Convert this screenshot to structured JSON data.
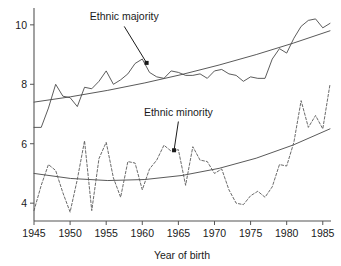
{
  "chart_data": {
    "type": "line",
    "title": "",
    "xlabel": "Year of birth",
    "ylabel": "",
    "xlim": [
      1945,
      1986
    ],
    "ylim": [
      3.4,
      10.5
    ],
    "xticks": [
      1945,
      1950,
      1955,
      1960,
      1965,
      1970,
      1975,
      1980,
      1985
    ],
    "yticks": [
      4,
      6,
      8,
      10
    ],
    "grid": false,
    "legend_position": "inline-annotations",
    "x": [
      1945,
      1946,
      1947,
      1948,
      1949,
      1950,
      1951,
      1952,
      1953,
      1954,
      1955,
      1956,
      1957,
      1958,
      1959,
      1960,
      1961,
      1962,
      1963,
      1964,
      1965,
      1966,
      1967,
      1968,
      1969,
      1970,
      1971,
      1972,
      1973,
      1974,
      1975,
      1976,
      1977,
      1978,
      1979,
      1980,
      1981,
      1982,
      1983,
      1984,
      1985,
      1986
    ],
    "series": [
      {
        "name": "Ethnic majority",
        "style": "solid",
        "color": "#4a4a4a",
        "values": [
          6.55,
          6.55,
          7.2,
          8.0,
          7.6,
          7.55,
          7.25,
          7.9,
          7.85,
          8.1,
          8.45,
          8.0,
          8.15,
          8.35,
          8.7,
          8.85,
          8.4,
          8.25,
          8.2,
          8.45,
          8.4,
          8.3,
          8.3,
          8.35,
          8.2,
          8.45,
          8.5,
          8.35,
          8.3,
          8.1,
          8.25,
          8.2,
          8.2,
          8.85,
          9.2,
          9.05,
          9.55,
          9.95,
          10.15,
          10.2,
          9.9,
          10.05
        ]
      },
      {
        "name": "Ethnic minority",
        "style": "dashed",
        "color": "#5a5a5a",
        "values": [
          3.75,
          4.6,
          5.3,
          5.1,
          4.35,
          3.7,
          4.8,
          6.1,
          3.75,
          5.5,
          6.05,
          4.85,
          4.2,
          5.4,
          5.35,
          4.45,
          5.15,
          5.45,
          5.95,
          5.75,
          5.8,
          4.6,
          5.9,
          5.45,
          5.4,
          5.0,
          5.15,
          4.45,
          4.0,
          3.95,
          4.25,
          4.4,
          4.2,
          4.55,
          5.3,
          5.25,
          6.05,
          7.45,
          6.55,
          6.95,
          6.5,
          8.0
        ]
      }
    ],
    "trends": [
      {
        "name": "Ethnic majority trend",
        "for_series": "Ethnic majority",
        "start": [
          1945,
          7.4
        ],
        "end": [
          1986,
          9.8
        ],
        "shape": "gently-curved-increasing"
      },
      {
        "name": "Ethnic minority trend",
        "for_series": "Ethnic minority",
        "start": [
          1945,
          5.0
        ],
        "end": [
          1986,
          6.5
        ],
        "shape": "u-shaped-then-increasing"
      }
    ],
    "annotations": [
      {
        "text": "Ethnic majority",
        "label_x": 1957.5,
        "label_y": 10.15,
        "points_to_x": 1960.6,
        "points_to_y": 8.72
      },
      {
        "text": "Ethnic minority",
        "label_x": 1965.0,
        "label_y": 6.95,
        "points_to_x": 1964.4,
        "points_to_y": 5.78
      }
    ]
  },
  "axis": {
    "x_title": "Year of birth",
    "x_tick_labels": [
      "1945",
      "1950",
      "1955",
      "1960",
      "1965",
      "1970",
      "1975",
      "1980",
      "1985"
    ],
    "y_tick_labels": [
      "10",
      "8",
      "6",
      "4"
    ]
  },
  "colors": {
    "background": "#ffffff",
    "axis": "#555555",
    "text": "#1a1a1a",
    "majority": "#4a4a4a",
    "minority": "#5a5a5a",
    "trend": "#5a5a5a"
  }
}
